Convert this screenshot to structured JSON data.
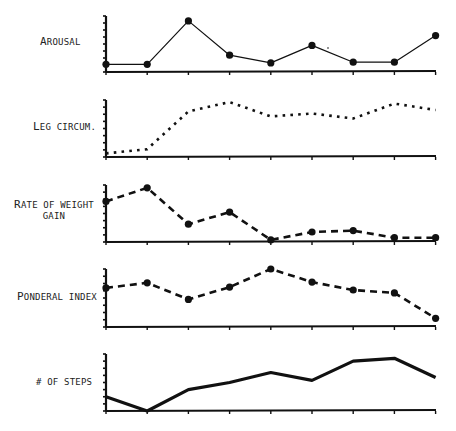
{
  "chart_data": {
    "type": "line",
    "title": "",
    "layout": "five vertically stacked small-multiple line panels sharing an unlabeled x-axis with 9 time points",
    "x": [
      1,
      2,
      3,
      4,
      5,
      6,
      7,
      8,
      9
    ],
    "xlabel": "",
    "grid": false,
    "legend": "none (each panel labeled at left)",
    "y_scale": "unlabeled tick marks, 0-8 relative units",
    "panels": [
      {
        "name": "Arousal",
        "label_display": "AROUSAL",
        "style": "solid thin line with filled circle markers",
        "values": [
          1.1,
          1.1,
          7.3,
          2.4,
          1.3,
          3.8,
          1.4,
          1.4,
          5.2
        ],
        "ylim": [
          0,
          8
        ]
      },
      {
        "name": "Leg circum.",
        "label_display": "LEG CIRCUM.",
        "style": "dotted line, no markers",
        "values": [
          0.5,
          1.1,
          6.4,
          7.7,
          5.7,
          6.1,
          5.4,
          7.5,
          6.6
        ],
        "ylim": [
          0,
          8
        ]
      },
      {
        "name": "Rate of weight gain",
        "label_display": "RATE OF WEIGHT GAIN",
        "style": "dashed line with filled circle markers",
        "values": [
          5.7,
          7.6,
          2.5,
          4.2,
          0.3,
          1.4,
          1.6,
          0.6,
          0.6
        ],
        "ylim": [
          0,
          8
        ]
      },
      {
        "name": "Ponderal index",
        "label_display": "PONDERAL INDEX",
        "style": "dashed line with filled circle markers",
        "values": [
          5.4,
          6.1,
          3.8,
          5.5,
          8.0,
          6.2,
          5.1,
          4.7,
          1.2
        ],
        "ylim": [
          0,
          8
        ]
      },
      {
        "name": "# of steps",
        "label_display": "# OF STEPS",
        "style": "thick solid line, no markers",
        "values": [
          2.0,
          0.0,
          3.0,
          4.0,
          5.4,
          4.3,
          7.0,
          7.4,
          4.7
        ],
        "ylim": [
          0,
          8
        ]
      }
    ]
  },
  "labels": {
    "arousal_cap": "A",
    "arousal_rest": "ROUSAL",
    "leg_cap": "L",
    "leg_rest": "EG CIRCUM.",
    "rate_cap": "R",
    "rate_rest": "ATE OF WEIGHT",
    "rate_line2": "GAIN",
    "ponderal_cap": "P",
    "ponderal_rest": "ONDERAL INDEX",
    "steps": "# OF STEPS"
  },
  "colors": {
    "ink": "#111111",
    "background": "#ffffff"
  }
}
